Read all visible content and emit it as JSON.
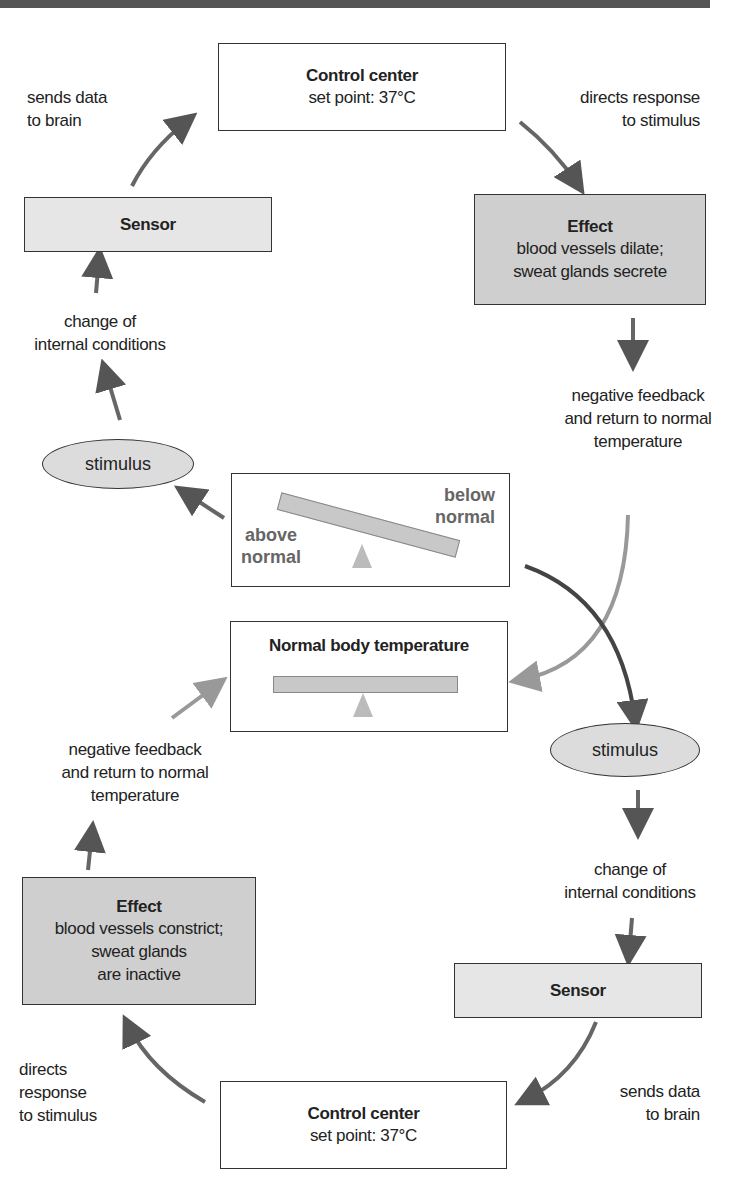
{
  "diagram": {
    "top_cycle": {
      "control_center": {
        "title": "Control center",
        "subtitle": "set point: 37°C"
      },
      "sensor": {
        "title": "Sensor"
      },
      "effect": {
        "title": "Effect",
        "lines": [
          "blood vessels dilate;",
          "sweat glands secrete"
        ]
      },
      "stimulus": "stimulus",
      "labels": {
        "sends_data": [
          "sends data",
          "to brain"
        ],
        "directs_response": [
          "directs response",
          "to stimulus"
        ],
        "change_of": [
          "change of",
          "internal conditions"
        ],
        "negative_feedback": [
          "negative feedback",
          "and return to normal",
          "temperature"
        ]
      },
      "balance": {
        "left_label": [
          "above",
          "normal"
        ],
        "right_label": [
          "below",
          "normal"
        ]
      }
    },
    "center": {
      "title": "Normal body temperature"
    },
    "bottom_cycle": {
      "stimulus": "stimulus",
      "labels": {
        "change_of": [
          "change of",
          "internal conditions"
        ],
        "sends_data": [
          "sends data",
          "to brain"
        ],
        "directs_response": [
          "directs",
          "response",
          "to stimulus"
        ],
        "negative_feedback": [
          "negative feedback",
          "and return to normal",
          "temperature"
        ]
      },
      "sensor": {
        "title": "Sensor"
      },
      "control_center": {
        "title": "Control center",
        "subtitle": "set point: 37°C"
      },
      "effect": {
        "title": "Effect",
        "lines": [
          "blood vessels constrict;",
          "sweat glands",
          "are inactive"
        ]
      }
    },
    "colors": {
      "arrow": "#555555",
      "arrow_light": "#999999",
      "box_dark": "#cfcfcf",
      "box_light": "#e6e6e6",
      "stroke": "#333333"
    }
  }
}
